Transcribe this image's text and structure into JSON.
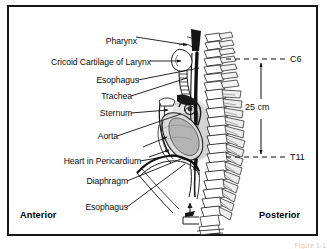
{
  "figure": {
    "title_hidden": "Sagittal section of neck and thorax showing esophagus",
    "caption": "Figure 1-1"
  },
  "labels": {
    "left": [
      {
        "text": "Pharynx",
        "x": 132,
        "y": 33,
        "anchor": "right",
        "tip_x": 185,
        "tip_y": 42,
        "arrow": true
      },
      {
        "text": "Cricoid Cartilage of Larynx",
        "x": 146,
        "y": 57,
        "anchor": "right",
        "tip_x": 179,
        "tip_y": 58,
        "arrow": true
      },
      {
        "text": "Esophagus",
        "x": 134,
        "y": 76,
        "anchor": "right",
        "tip_x": 196,
        "tip_y": 65,
        "arrow": false
      },
      {
        "text": "Trachea",
        "x": 127,
        "y": 92,
        "anchor": "right",
        "tip_x": 183,
        "tip_y": 76,
        "arrow": false
      },
      {
        "text": "Sternum",
        "x": 127,
        "y": 109,
        "anchor": "right",
        "tip_x": 168,
        "tip_y": 107,
        "arrow": true
      },
      {
        "text": "Aorta",
        "x": 113,
        "y": 132,
        "anchor": "right",
        "tip_x": 178,
        "tip_y": 112,
        "arrow": false
      },
      {
        "text": "Heart in Pericardium",
        "x": 136,
        "y": 157,
        "anchor": "right",
        "tip_x": 174,
        "tip_y": 152,
        "arrow": true
      },
      {
        "text": "Diaphragm",
        "x": 123,
        "y": 177,
        "anchor": "right",
        "tip_x": 178,
        "tip_y": 156,
        "arrow": false
      },
      {
        "text": "Esophagus",
        "x": 123,
        "y": 203,
        "anchor": "right",
        "tip_x": 180,
        "tip_y": 161,
        "arrow": false
      }
    ],
    "levels": [
      {
        "text": "C6",
        "x": 288,
        "y": 61,
        "line_y": 57,
        "line_x1": 224,
        "line_x2": 283
      },
      {
        "text": "T11",
        "x": 288,
        "y": 159,
        "line_y": 155,
        "line_x1": 224,
        "line_x2": 283
      }
    ],
    "measurement": {
      "text": "25 cm",
      "x": 245,
      "y": 110,
      "arrow_x": 259,
      "arrow_top": 57,
      "arrow_bottom": 155
    }
  },
  "orientation": {
    "anterior": {
      "text": "Anterior",
      "x": 18,
      "y": 215
    },
    "posterior": {
      "text": "Posterior",
      "x": 257,
      "y": 215
    }
  },
  "colors": {
    "frame": "#151515",
    "ink": "#0b0b0b",
    "leader": "#101010",
    "dash": "#111111",
    "shade_light": "#d9d9d9",
    "shade_mid": "#9a9a9a",
    "shade_dark": "#3a3a3a"
  }
}
